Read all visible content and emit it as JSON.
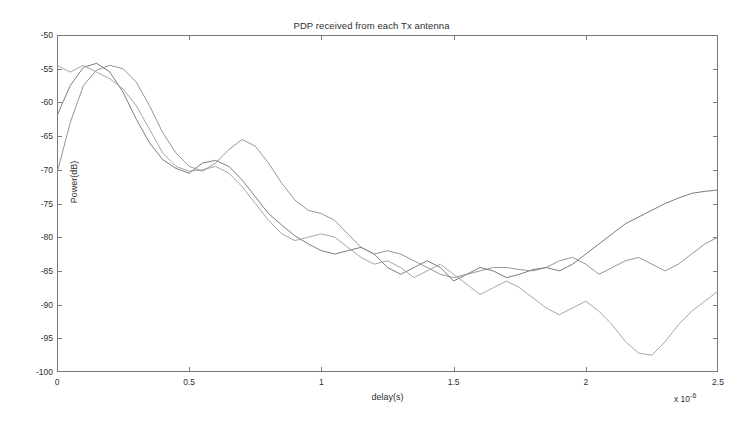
{
  "figure": {
    "title": "PDP received from each Tx antenna",
    "background_color": "#ffffff",
    "axis_color": "#7a7a7a",
    "text_color": "#2f2f2f"
  },
  "axes": {
    "x_label": "delay(s)",
    "y_label": "Power(dB)",
    "x_exponent_prefix": "x 10",
    "x_exponent_value": "-6",
    "x_ticks": [
      "0",
      "0.5",
      "1",
      "1.5",
      "2",
      "2.5"
    ],
    "y_ticks": [
      "-50",
      "-55",
      "-60",
      "-65",
      "-70",
      "-75",
      "-80",
      "-85",
      "-90",
      "-95",
      "-100"
    ]
  },
  "chart_data": {
    "type": "line",
    "title": "PDP received from each Tx antenna",
    "xlabel": "delay(s)",
    "ylabel": "Power(dB)",
    "xlim": [
      0,
      2.5
    ],
    "ylim": [
      -100,
      -50
    ],
    "x_scale_exponent": -6,
    "x_tick_values": [
      0,
      0.5,
      1,
      1.5,
      2,
      2.5
    ],
    "y_tick_values": [
      -50,
      -55,
      -60,
      -65,
      -70,
      -75,
      -80,
      -85,
      -90,
      -95,
      -100
    ],
    "grid": false,
    "legend": "none",
    "colors": [
      "#6e6e6e",
      "#8a8a8a",
      "#9c9c9c"
    ],
    "x": [
      0,
      0.05,
      0.1,
      0.15,
      0.2,
      0.25,
      0.3,
      0.35,
      0.4,
      0.45,
      0.5,
      0.55,
      0.6,
      0.65,
      0.7,
      0.75,
      0.8,
      0.85,
      0.9,
      0.95,
      1.0,
      1.05,
      1.1,
      1.15,
      1.2,
      1.25,
      1.3,
      1.35,
      1.4,
      1.45,
      1.5,
      1.55,
      1.6,
      1.65,
      1.7,
      1.75,
      1.8,
      1.85,
      1.9,
      1.95,
      2.0,
      2.05,
      2.1,
      2.15,
      2.2,
      2.25,
      2.3,
      2.35,
      2.4,
      2.45,
      2.5
    ],
    "series": [
      {
        "name": "Tx antenna 1",
        "color": "#6e6e6e",
        "values": [
          -62.0,
          -57.5,
          -54.8,
          -54.2,
          -55.5,
          -58.5,
          -62.5,
          -66.0,
          -68.5,
          -69.8,
          -70.5,
          -69.0,
          -68.6,
          -69.5,
          -71.5,
          -74.0,
          -76.5,
          -78.2,
          -79.8,
          -81.0,
          -82.0,
          -82.5,
          -82.0,
          -81.5,
          -82.5,
          -84.5,
          -85.5,
          -84.5,
          -83.5,
          -84.5,
          -86.5,
          -85.5,
          -84.5,
          -85.0,
          -86.0,
          -85.5,
          -84.8,
          -84.5,
          -85.0,
          -84.0,
          -82.5,
          -81.0,
          -79.5,
          -78.0,
          -77.0,
          -76.0,
          -75.0,
          -74.2,
          -73.5,
          -73.2,
          -73.0
        ]
      },
      {
        "name": "Tx antenna 2",
        "color": "#8a8a8a",
        "values": [
          -70.5,
          -63.0,
          -57.5,
          -55.2,
          -54.5,
          -55.0,
          -57.0,
          -60.5,
          -64.5,
          -67.5,
          -69.5,
          -70.2,
          -69.0,
          -67.0,
          -65.5,
          -66.5,
          -69.0,
          -72.0,
          -74.5,
          -76.0,
          -76.5,
          -77.5,
          -79.5,
          -81.5,
          -82.5,
          -82.0,
          -82.5,
          -83.5,
          -84.5,
          -85.5,
          -86.0,
          -85.5,
          -85.0,
          -84.5,
          -84.5,
          -84.8,
          -85.0,
          -84.5,
          -83.5,
          -83.0,
          -84.0,
          -85.5,
          -84.5,
          -83.5,
          -83.0,
          -84.0,
          -85.0,
          -84.0,
          -82.5,
          -81.0,
          -80.0
        ]
      },
      {
        "name": "Tx antenna 3",
        "color": "#9c9c9c",
        "values": [
          -54.5,
          -55.5,
          -54.5,
          -55.5,
          -56.5,
          -58.0,
          -60.5,
          -64.0,
          -67.5,
          -69.5,
          -70.2,
          -70.0,
          -69.5,
          -70.5,
          -72.5,
          -75.0,
          -77.5,
          -79.5,
          -80.5,
          -80.0,
          -79.5,
          -80.0,
          -81.5,
          -83.0,
          -84.0,
          -83.5,
          -84.5,
          -86.0,
          -85.0,
          -84.0,
          -85.5,
          -87.0,
          -88.5,
          -87.5,
          -86.5,
          -87.5,
          -89.0,
          -90.5,
          -91.5,
          -90.5,
          -89.5,
          -91.0,
          -93.0,
          -95.5,
          -97.2,
          -97.5,
          -95.5,
          -93.0,
          -91.0,
          -89.5,
          -88.0
        ]
      }
    ]
  }
}
